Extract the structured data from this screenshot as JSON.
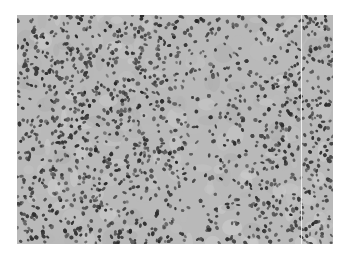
{
  "figure": {
    "type": "histology-micrograph",
    "stain": "grayscale",
    "background_color": "#ffffff",
    "tissue_color": "#b9b9b9",
    "nucleus_color": "#4a4a4a"
  }
}
